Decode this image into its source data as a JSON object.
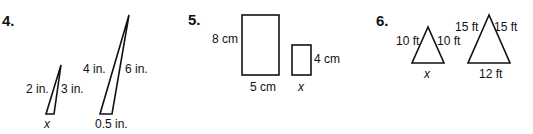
{
  "problems": [
    {
      "number": "4.",
      "small": {
        "left": "2 in.",
        "right": "3 in.",
        "base": "x"
      },
      "large": {
        "left": "4 in.",
        "right": "6 in.",
        "base": "0.5 in."
      }
    },
    {
      "number": "5.",
      "large": {
        "height": "8 cm",
        "width": "5 cm"
      },
      "small": {
        "height": "4 cm",
        "width": "x"
      }
    },
    {
      "number": "6.",
      "small": {
        "left": "10 ft",
        "right": "10 ft",
        "base": "x"
      },
      "large": {
        "left": "15 ft",
        "right": "15 ft",
        "base": "12 ft"
      }
    }
  ]
}
